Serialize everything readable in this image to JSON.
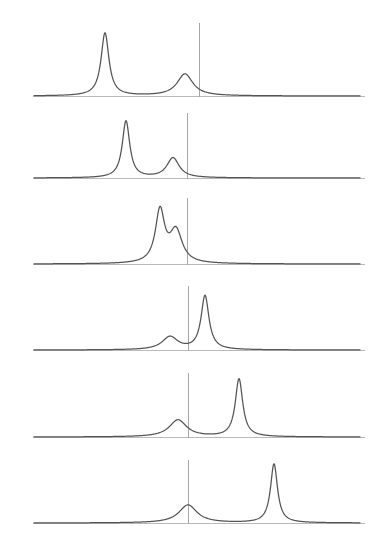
{
  "figure": {
    "title": "",
    "background_color": "#ffffff",
    "width": 379,
    "height": 557,
    "curve_color": "#545454",
    "axis_color": "#b9b9b9",
    "marker_color": "#a6a6a6",
    "panel_count": 6
  },
  "chart_data": {
    "type": "line",
    "title": "",
    "subtitle": "",
    "xlabel": "",
    "ylabel": "",
    "grid": false,
    "legend": "none",
    "xlim": [
      0,
      379
    ],
    "shared_axis": {
      "x_start": 33,
      "x_end": 365,
      "curve_x_start": 34,
      "curve_x_end": 360
    },
    "panels": [
      {
        "index": 1,
        "baseline_y": 96,
        "marker_x": 199,
        "marker_top_y": 23,
        "peaks": [
          {
            "center": 105,
            "height": 63,
            "width": 9.5,
            "shape": "lorentzian"
          },
          {
            "center": 185,
            "height": 22,
            "width": 19.0,
            "shape": "lorentzian"
          }
        ]
      },
      {
        "index": 2,
        "baseline_y": 178,
        "marker_x": 187,
        "marker_top_y": 113,
        "peaks": [
          {
            "center": 126,
            "height": 57,
            "width": 9.0,
            "shape": "lorentzian"
          },
          {
            "center": 173,
            "height": 20,
            "width": 15.0,
            "shape": "lorentzian"
          }
        ]
      },
      {
        "index": 3,
        "baseline_y": 264,
        "marker_x": 187,
        "marker_top_y": 198,
        "peaks": [
          {
            "center": 160,
            "height": 52,
            "width": 11.0,
            "shape": "lorentzian"
          },
          {
            "center": 176,
            "height": 32,
            "width": 15.0,
            "shape": "lorentzian"
          }
        ]
      },
      {
        "index": 4,
        "baseline_y": 350,
        "marker_x": 188,
        "marker_top_y": 286,
        "peaks": [
          {
            "center": 170,
            "height": 13,
            "width": 19.0,
            "shape": "lorentzian"
          },
          {
            "center": 205,
            "height": 54,
            "width": 9.5,
            "shape": "lorentzian"
          }
        ]
      },
      {
        "index": 5,
        "baseline_y": 437,
        "marker_x": 188,
        "marker_top_y": 373,
        "peaks": [
          {
            "center": 178,
            "height": 17,
            "width": 21.0,
            "shape": "lorentzian"
          },
          {
            "center": 239,
            "height": 58,
            "width": 9.0,
            "shape": "lorentzian"
          }
        ]
      },
      {
        "index": 6,
        "baseline_y": 523,
        "marker_x": 188,
        "marker_top_y": 460,
        "peaks": [
          {
            "center": 188,
            "height": 18,
            "width": 22.0,
            "shape": "lorentzian"
          },
          {
            "center": 274,
            "height": 59,
            "width": 8.5,
            "shape": "lorentzian"
          }
        ]
      }
    ]
  }
}
